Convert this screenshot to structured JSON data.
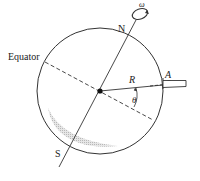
{
  "diagram": {
    "labels": {
      "north": "N",
      "south": "S",
      "equator": "Equator",
      "radius": "R",
      "angle": "θ",
      "point": "A",
      "angular_velocity": "ω"
    },
    "colors": {
      "stroke": "#333333",
      "shade": "#bdbdbd",
      "background": "#ffffff"
    }
  }
}
